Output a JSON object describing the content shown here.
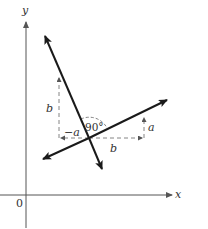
{
  "diagram": {
    "type": "perpendicular-lines",
    "axes": {
      "x_label": "x",
      "y_label": "y",
      "origin_label": "0"
    },
    "labels": {
      "left_rise": "b",
      "left_run": "−a",
      "angle": "90°",
      "right_run": "b",
      "right_rise": "a"
    },
    "colors": {
      "line": "#1a1a1a",
      "axis": "#555555",
      "dashed": "#777777",
      "text": "#333333"
    }
  }
}
